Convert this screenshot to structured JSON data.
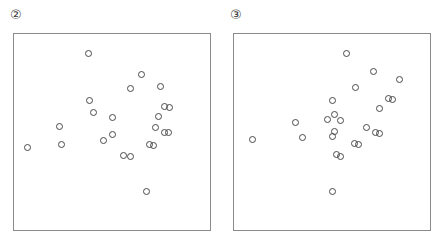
{
  "figure": {
    "background_color": "#ffffff",
    "marker_color": "#4a4a4a",
    "frame_color": "#8b8b8b",
    "label_color": "#3a3a3a"
  },
  "panels": [
    {
      "label": "②",
      "label_name": "circled-two",
      "frame": {
        "x": 13,
        "y": 33,
        "width": 198,
        "height": 198
      }
    },
    {
      "label": "③",
      "label_name": "circled-three",
      "frame": {
        "x": 14,
        "y": 33,
        "width": 198,
        "height": 198
      }
    }
  ],
  "chart_data": [
    {
      "type": "scatter",
      "title": "②",
      "xlabel": "",
      "ylabel": "",
      "xlim": [
        0,
        1
      ],
      "ylim": [
        0,
        1
      ],
      "grid": false,
      "legend": "none",
      "marker": "open-circle",
      "n_points": 24,
      "series": [
        {
          "name": "panel-2-points",
          "points": [
            [
              0.378,
              0.899
            ],
            [
              0.652,
              0.792
            ],
            [
              0.592,
              0.722
            ],
            [
              0.747,
              0.732
            ],
            [
              0.383,
              0.661
            ],
            [
              0.77,
              0.631
            ],
            [
              0.793,
              0.626
            ],
            [
              0.408,
              0.601
            ],
            [
              0.738,
              0.581
            ],
            [
              0.505,
              0.576
            ],
            [
              0.232,
              0.53
            ],
            [
              0.722,
              0.525
            ],
            [
              0.768,
              0.5
            ],
            [
              0.788,
              0.495
            ],
            [
              0.505,
              0.485
            ],
            [
              0.459,
              0.455
            ],
            [
              0.242,
              0.434
            ],
            [
              0.692,
              0.434
            ],
            [
              0.712,
              0.429
            ],
            [
              0.071,
              0.419
            ],
            [
              0.56,
              0.379
            ],
            [
              0.596,
              0.374
            ],
            [
              0.676,
              0.197
            ]
          ]
        }
      ]
    },
    {
      "type": "scatter",
      "title": "③",
      "xlabel": "",
      "ylabel": "",
      "xlim": [
        0,
        1
      ],
      "ylim": [
        0,
        1
      ],
      "grid": false,
      "legend": "none",
      "marker": "open-circle",
      "n_points": 24,
      "series": [
        {
          "name": "panel-3-points",
          "points": [
            [
              0.576,
              0.899
            ],
            [
              0.712,
              0.808
            ],
            [
              0.843,
              0.768
            ],
            [
              0.621,
              0.727
            ],
            [
              0.788,
              0.672
            ],
            [
              0.808,
              0.667
            ],
            [
              0.505,
              0.662
            ],
            [
              0.742,
              0.621
            ],
            [
              0.515,
              0.591
            ],
            [
              0.475,
              0.566
            ],
            [
              0.545,
              0.561
            ],
            [
              0.313,
              0.551
            ],
            [
              0.677,
              0.525
            ],
            [
              0.515,
              0.505
            ],
            [
              0.722,
              0.495
            ],
            [
              0.742,
              0.49
            ],
            [
              0.5,
              0.475
            ],
            [
              0.348,
              0.47
            ],
            [
              0.096,
              0.46
            ],
            [
              0.616,
              0.44
            ],
            [
              0.636,
              0.435
            ],
            [
              0.525,
              0.384
            ],
            [
              0.545,
              0.374
            ],
            [
              0.5,
              0.197
            ]
          ]
        }
      ]
    }
  ]
}
